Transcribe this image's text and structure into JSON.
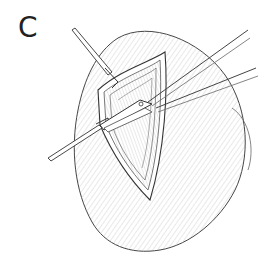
{
  "figure": {
    "panel_label": "C",
    "elements": [
      {
        "name": "organ-body",
        "description": "rounded organ / tissue mass with hatched shading"
      },
      {
        "name": "incision",
        "description": "elliptical layered incision opening"
      },
      {
        "name": "retractor-hook-upper",
        "description": "pointed hook retracting upper edge"
      },
      {
        "name": "retractor-hook-lower",
        "description": "pointed hook retracting lower-left edge"
      },
      {
        "name": "scissors",
        "description": "surgical scissors inserted into incision from right"
      }
    ],
    "colors": {
      "background": "#ffffff",
      "ink": "#333333",
      "hatch": "#9a9a9a"
    }
  }
}
